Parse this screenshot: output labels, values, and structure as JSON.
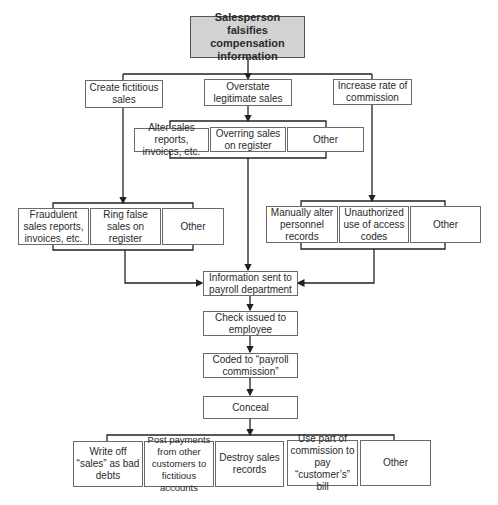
{
  "root": "Salesperson falsifies compensation information",
  "level2": [
    "Create fictitious sales",
    "Overstate legitimate sales",
    "Increase rate of commission"
  ],
  "overstate_methods": [
    "Alter sales reports, invoices, etc.",
    "Overring sales on register",
    "Other"
  ],
  "fictitious_methods": [
    "Fraudulent sales reports, invoices, etc.",
    "Ring false sales on register",
    "Other"
  ],
  "commission_methods": [
    "Manually alter personnel records",
    "Unauthorized use of access codes",
    "Other"
  ],
  "flow": [
    "Information sent to payroll department",
    "Check issued to employee",
    "Coded to “payroll commission”",
    "Conceal"
  ],
  "conceal_methods": [
    "Write off “sales” as bad debts",
    "Post payments from other customers to fictitious accounts",
    "Destroy sales records",
    "Use part of commission to pay “customer’s” bill",
    "Other"
  ],
  "colors": {
    "root_fill": "#d2d2d2",
    "line": "#222222",
    "border": "#6a6a6a"
  }
}
